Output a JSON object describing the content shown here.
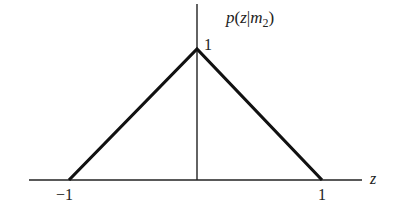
{
  "diagram": {
    "title_label": "p(z|m₂)",
    "title_parts": {
      "p": "p",
      "open": "(",
      "z": "z",
      "bar": "|",
      "m": "m",
      "sub": "2",
      "close": ")"
    },
    "x_axis_label": "z",
    "peak_label": "1",
    "tick_left_label": "−1",
    "tick_right_label": "1",
    "shape": "triangular density",
    "points": [
      {
        "z": -1,
        "p": 0
      },
      {
        "z": 0,
        "p": 1
      },
      {
        "z": 1,
        "p": 0
      }
    ],
    "colors": {
      "ink": "#222222",
      "background": "#ffffff"
    }
  }
}
